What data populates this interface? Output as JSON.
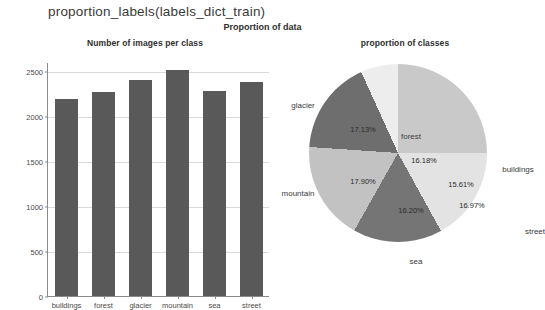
{
  "header": {
    "code_title": "proportion_labels(labels_dict_train)",
    "figure_suptitle": "Proportion of data"
  },
  "chart_data": [
    {
      "type": "bar",
      "title": "Number of images per class",
      "xlabel": "",
      "ylabel": "",
      "categories": [
        "buildings",
        "forest",
        "glacier",
        "mountain",
        "sea",
        "street"
      ],
      "values": [
        2191,
        2271,
        2404,
        2512,
        2274,
        2382
      ],
      "ylim": [
        0,
        2600
      ],
      "yticks": [
        0,
        500,
        1000,
        1500,
        2000,
        2500
      ],
      "ytick_labels": [
        "0",
        "500",
        "1000",
        "1500",
        "2000",
        "2500"
      ],
      "grid": true,
      "bar_color": "#595959",
      "legend": "none"
    },
    {
      "type": "pie",
      "title": "proportion of classes",
      "labels": [
        "buildings",
        "forest",
        "glacier",
        "mountain",
        "sea",
        "street"
      ],
      "values": [
        15.61,
        16.18,
        17.13,
        17.9,
        16.2,
        16.97
      ],
      "pct_labels": [
        "15.61%",
        "16.18%",
        "17.13%",
        "17.90%",
        "16.20%",
        "16.97%"
      ],
      "slice_colors": [
        "#c9c9c9",
        "#ededed",
        "#6e6e6e",
        "#c2c2c2",
        "#757575",
        "#e3e3e3"
      ],
      "legend": "none",
      "startangle": 0,
      "counterclock": true
    }
  ],
  "bar_geometry": {
    "plot_height_px": 234,
    "y_max": 2600
  },
  "pie_geometry": {
    "slices": [
      {
        "label": "buildings",
        "start_deg": 0,
        "end_deg": 56.196,
        "pct_x": 63.0,
        "pct_y": 31.0,
        "label_x": 120.0,
        "label_y": 16.0
      },
      {
        "label": "forest",
        "start_deg": 56.196,
        "end_deg": 114.444,
        "pct_x": 26.0,
        "pct_y": 7.0,
        "label_x": 13.0,
        "label_y": -17.0
      },
      {
        "label": "glacier",
        "start_deg": 114.444,
        "end_deg": 176.112,
        "pct_x": -35.0,
        "pct_y": -24.0,
        "label_x": -95.0,
        "label_y": -48.0
      },
      {
        "label": "mountain",
        "start_deg": 176.112,
        "end_deg": 240.552,
        "pct_x": -35.0,
        "pct_y": 28.0,
        "label_x": -100.0,
        "label_y": 40.0
      },
      {
        "label": "sea",
        "start_deg": 240.552,
        "end_deg": 298.872,
        "pct_x": 13.0,
        "pct_y": 57.0,
        "label_x": 18.0,
        "label_y": 108.0
      },
      {
        "label": "street",
        "start_deg": 298.872,
        "end_deg": 360,
        "pct_x": 74.0,
        "pct_y": 52.0,
        "label_x": 137.0,
        "label_y": 78.0
      }
    ]
  }
}
